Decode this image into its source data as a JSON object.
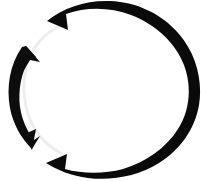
{
  "canvas": {
    "width": 201,
    "height": 181,
    "background_color": "#ffffff",
    "title": "Circular refresh arrows icon"
  },
  "icon": {
    "name": "refresh-circular-arrows-icon",
    "description": "Two black arcs arranged in a ring forming a circular refresh / sync / rotate symbol",
    "fill_color": "#0a0a0a",
    "faint_arc_color": "#ededed",
    "center_x": 100,
    "center_y": 90,
    "radius_x": 82,
    "radius_y": 74,
    "parts": [
      {
        "name": "thick-outer-arc",
        "role": "major sweep",
        "thickness_px": 18,
        "start_clock": "10:00",
        "end_clock": "07:30",
        "direction": "clockwise",
        "end_cap": "notched-tail"
      },
      {
        "name": "thin-left-arc",
        "role": "minor sweep with arrowheads",
        "thickness_px": 12,
        "start_clock": "09:45",
        "end_clock": "07:45",
        "direction": "counterclockwise",
        "end_cap": "arrowhead"
      },
      {
        "name": "arrowhead-upper-left",
        "points_toward": "up",
        "tip_x": 26,
        "tip_y": 47
      },
      {
        "name": "arrowhead-lower-left",
        "points_toward": "down",
        "tip_x": 25,
        "tip_y": 142
      },
      {
        "name": "faint-inner-arc",
        "role": "anti-alias ghost edge",
        "color": "#ededed"
      }
    ]
  }
}
